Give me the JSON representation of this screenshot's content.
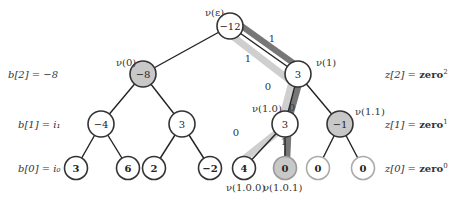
{
  "colors": {
    "edge": "#222222",
    "node_stroke": "#333333",
    "node_fill_white": "#ffffff",
    "node_fill_gray": "#c8c8c8",
    "light_path": "#cfcfcf",
    "dark_path": "#777777",
    "leaf_light_stroke": "#aaaaaa"
  },
  "left_labels": [
    {
      "text": "b[2] = −8",
      "x": 8,
      "y": 78
    },
    {
      "text": "b[1] = i₁",
      "x": 18,
      "y": 128
    },
    {
      "text": "b[0] = i₀",
      "x": 18,
      "y": 172
    }
  ],
  "right_labels": [
    {
      "text": "z[2] = ",
      "bold": "zero",
      "sup": "2",
      "x": 385,
      "y": 78
    },
    {
      "text": "z[1] = ",
      "bold": "zero",
      "sup": "1",
      "x": 385,
      "y": 128
    },
    {
      "text": "z[0] = ",
      "bold": "zero",
      "sup": "0",
      "x": 385,
      "y": 172
    }
  ],
  "nodes": [
    {
      "id": "root",
      "value": "−12",
      "x": 230,
      "y": 26,
      "fill": "white",
      "label": "ν(ε)",
      "lx": 205,
      "ly": 16
    },
    {
      "id": "n0",
      "value": "−8",
      "x": 143,
      "y": 74,
      "fill": "gray",
      "label": "ν(0)",
      "lx": 116,
      "ly": 66
    },
    {
      "id": "n1",
      "value": "3",
      "x": 298,
      "y": 74,
      "fill": "white",
      "label": "ν(1)",
      "lx": 316,
      "ly": 66
    },
    {
      "id": "n00",
      "value": "−4",
      "x": 101,
      "y": 124,
      "fill": "white"
    },
    {
      "id": "n01",
      "value": "3",
      "x": 182,
      "y": 124,
      "fill": "white"
    },
    {
      "id": "n10",
      "value": "3",
      "x": 285,
      "y": 124,
      "fill": "white",
      "label": "ν(1.0)",
      "lx": 252,
      "ly": 112
    },
    {
      "id": "n11",
      "value": "−1",
      "x": 340,
      "y": 124,
      "fill": "gray",
      "label": "ν(1.1)",
      "lx": 355,
      "ly": 115
    },
    {
      "id": "l000",
      "value": "3",
      "x": 76,
      "y": 168,
      "fill": "white",
      "bold": true
    },
    {
      "id": "l001",
      "value": "6",
      "x": 128,
      "y": 168,
      "fill": "white",
      "bold": true
    },
    {
      "id": "l010",
      "value": "2",
      "x": 154,
      "y": 168,
      "fill": "white",
      "bold": true
    },
    {
      "id": "l011",
      "value": "−2",
      "x": 210,
      "y": 168,
      "fill": "white",
      "bold": true
    },
    {
      "id": "l100",
      "value": "4",
      "x": 244,
      "y": 168,
      "fill": "white",
      "bold": true,
      "label": "ν(1.0.0)",
      "lx": 226,
      "ly": 191
    },
    {
      "id": "l101",
      "value": "0",
      "x": 285,
      "y": 168,
      "fill": "gray",
      "bold": true,
      "label": "ν(1.0.1)",
      "lx": 263,
      "ly": 191
    },
    {
      "id": "l110",
      "value": "0",
      "x": 318,
      "y": 168,
      "fill": "white",
      "bold": true,
      "light": true
    },
    {
      "id": "l111",
      "value": "0",
      "x": 363,
      "y": 168,
      "fill": "white",
      "bold": true,
      "light": true
    }
  ],
  "edge_labels": [
    {
      "text": "1",
      "x": 272,
      "y": 38
    },
    {
      "text": "1",
      "x": 248,
      "y": 58
    },
    {
      "text": "0",
      "x": 268,
      "y": 86
    },
    {
      "text": "0",
      "x": 292,
      "y": 107
    },
    {
      "text": "0",
      "x": 236,
      "y": 132
    },
    {
      "text": "1",
      "x": 284,
      "y": 141
    }
  ]
}
